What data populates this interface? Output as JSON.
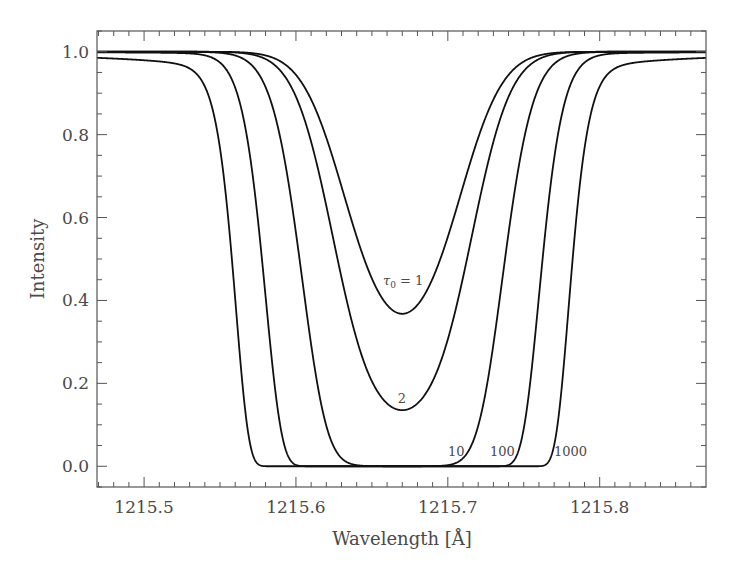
{
  "chart_data": {
    "type": "line",
    "title": "",
    "xlabel": "Wavelength [Å]",
    "ylabel": "Intensity",
    "xlim": [
      1215.469,
      1215.87
    ],
    "ylim": [
      -0.05,
      1.05
    ],
    "x_ticks": [
      1215.5,
      1215.6,
      1215.7,
      1215.8
    ],
    "x_tick_labels": [
      "1215.5",
      "1215.6",
      "1215.7",
      "1215.8"
    ],
    "y_ticks": [
      0.0,
      0.2,
      0.4,
      0.6,
      0.8,
      1.0
    ],
    "y_tick_labels": [
      "0.0",
      "0.2",
      "0.4",
      "0.6",
      "0.8",
      "1.0"
    ],
    "grid": false,
    "legend": "none (inline curve labels)",
    "line_center": 1215.67,
    "doppler_width": 0.0414,
    "damping_a": 0.00062,
    "series": [
      {
        "name": "τ0 = 1",
        "tau0": 1,
        "label": "τ0 = 1",
        "min_intensity": 0.375,
        "x": [
          1215.47,
          1215.55,
          1215.6,
          1215.62,
          1215.64,
          1215.65,
          1215.66,
          1215.67,
          1215.68,
          1215.69,
          1215.7,
          1215.72,
          1215.74,
          1215.79,
          1215.87
        ],
        "y": [
          1.0,
          1.0,
          0.945,
          0.81,
          0.59,
          0.49,
          0.41,
          0.375,
          0.41,
          0.49,
          0.59,
          0.81,
          0.945,
          1.0,
          1.0
        ]
      },
      {
        "name": "τ0 = 2",
        "tau0": 2,
        "label": "2",
        "min_intensity": 0.14,
        "x": [
          1215.47,
          1215.55,
          1215.6,
          1215.62,
          1215.64,
          1215.65,
          1215.66,
          1215.67,
          1215.68,
          1215.69,
          1215.7,
          1215.72,
          1215.74,
          1215.79,
          1215.87
        ],
        "y": [
          1.0,
          0.998,
          0.89,
          0.65,
          0.35,
          0.24,
          0.17,
          0.14,
          0.17,
          0.24,
          0.35,
          0.65,
          0.89,
          0.998,
          1.0
        ]
      },
      {
        "name": "τ0 = 10",
        "tau0": 10,
        "label": "10",
        "min_intensity": 0.0,
        "x": [
          1215.47,
          1215.55,
          1215.58,
          1215.6,
          1215.62,
          1215.64,
          1215.67,
          1215.7,
          1215.72,
          1215.74,
          1215.76,
          1215.79,
          1215.87
        ],
        "y": [
          1.0,
          0.985,
          0.86,
          0.56,
          0.16,
          0.005,
          0.0,
          0.005,
          0.16,
          0.56,
          0.86,
          0.985,
          1.0
        ]
      },
      {
        "name": "τ0 = 100",
        "tau0": 100,
        "label": "100",
        "min_intensity": 0.0,
        "x": [
          1215.47,
          1215.52,
          1215.55,
          1215.57,
          1215.59,
          1215.605,
          1215.67,
          1215.735,
          1215.75,
          1215.77,
          1215.79,
          1215.82,
          1215.87
        ],
        "y": [
          0.998,
          0.99,
          0.93,
          0.72,
          0.25,
          0.0,
          0.0,
          0.0,
          0.25,
          0.72,
          0.93,
          0.99,
          0.998
        ]
      },
      {
        "name": "τ0 = 1000",
        "tau0": 1000,
        "label": "1000",
        "min_intensity": 0.0,
        "x": [
          1215.47,
          1215.5,
          1215.53,
          1215.545,
          1215.555,
          1215.565,
          1215.58,
          1215.67,
          1215.76,
          1215.775,
          1215.785,
          1215.795,
          1215.81,
          1215.84,
          1215.87
        ],
        "y": [
          0.985,
          0.978,
          0.93,
          0.8,
          0.55,
          0.18,
          0.0,
          0.0,
          0.0,
          0.18,
          0.55,
          0.8,
          0.93,
          0.978,
          0.985
        ]
      }
    ],
    "annotations": [
      {
        "text": "τ0 = 1",
        "x": 1215.672,
        "y": 0.43
      },
      {
        "text": "2",
        "x": 1215.671,
        "y": 0.18
      },
      {
        "text": "10",
        "x": 1215.703,
        "y": 0.045
      },
      {
        "text": "100",
        "x": 1215.739,
        "y": 0.045
      },
      {
        "text": "1000",
        "x": 1215.786,
        "y": 0.045
      }
    ]
  },
  "labels": {
    "xlabel": "Wavelength [Å]",
    "ylabel": "Intensity",
    "tau_symbol": "τ",
    "tau_sub": "0",
    "tau_eq": " = 1",
    "lbl_2": "2",
    "lbl_10": "10",
    "lbl_100": "100",
    "lbl_1000": "1000"
  }
}
